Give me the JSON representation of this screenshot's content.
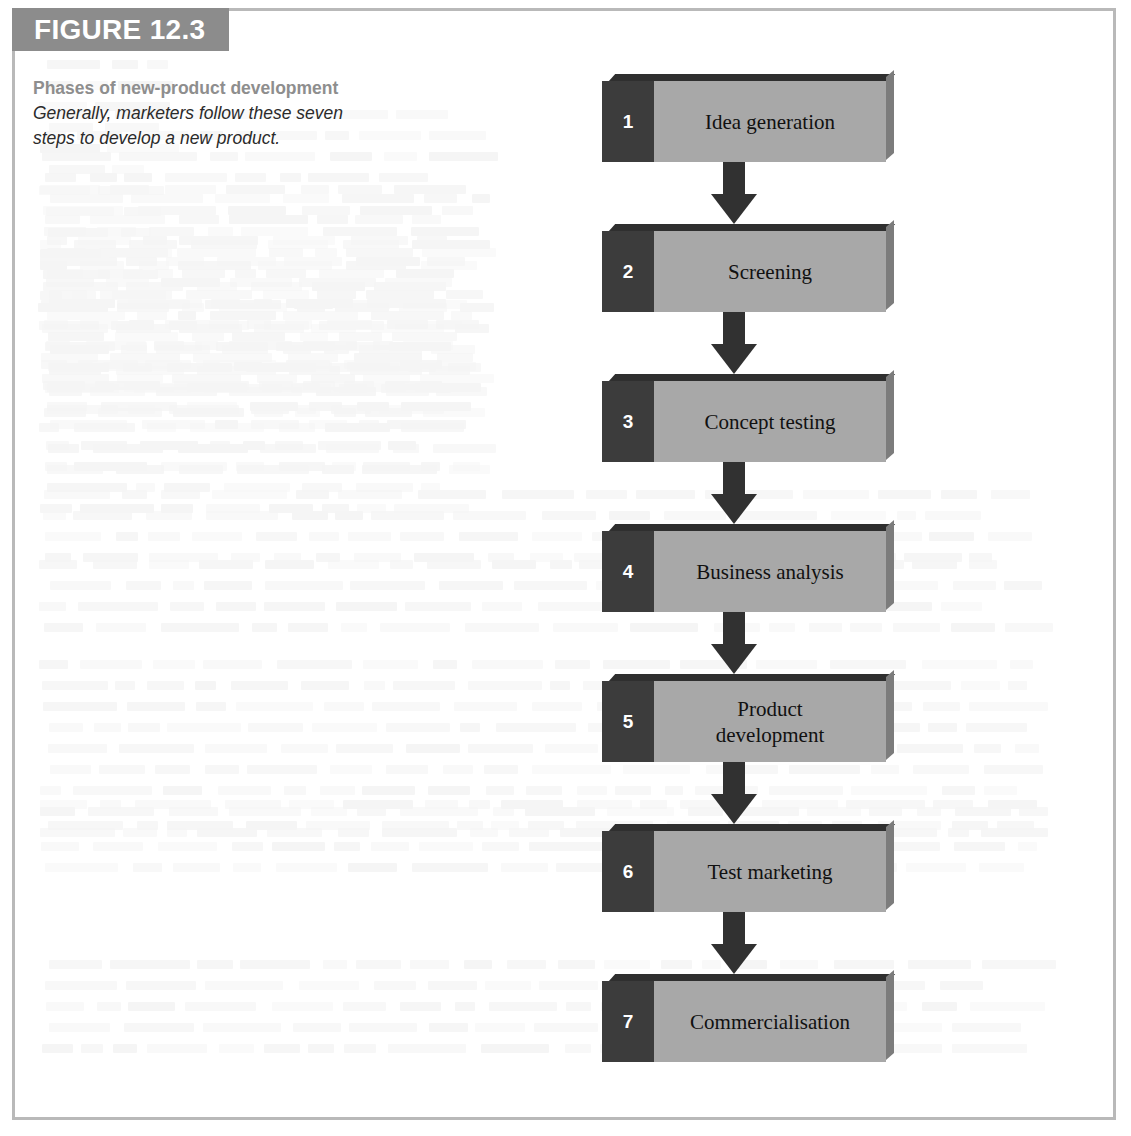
{
  "figure": {
    "number_label": "FIGURE 12.3",
    "caption_title": "Phases of new-product development",
    "caption_description": "Generally, marketers follow these seven steps to develop a new product."
  },
  "chart_data": {
    "type": "diagram",
    "subtype": "vertical-flowchart",
    "title": "Phases of new-product development",
    "direction": "top-to-bottom",
    "connector": "down-arrow",
    "steps": [
      {
        "number": "1",
        "label": "Idea generation"
      },
      {
        "number": "2",
        "label": "Screening"
      },
      {
        "number": "3",
        "label": "Concept testing"
      },
      {
        "number": "4",
        "label": "Business analysis"
      },
      {
        "number": "5",
        "label": "Product\ndevelopment"
      },
      {
        "number": "6",
        "label": "Test marketing"
      },
      {
        "number": "7",
        "label": "Commercialisation"
      }
    ]
  },
  "colors": {
    "header_bar": "#8c8c8c",
    "header_text": "#ffffff",
    "caption_title": "#8e8e8e",
    "caption_desc": "#2b2b2b",
    "step_number_block": "#3c3c3c",
    "step_label_block": "#a8a8a8",
    "step_bevel_top": "#2f2f2f",
    "step_bevel_right": "#7c7c7c",
    "arrow": "#313131",
    "frame_border": "#b9b9b9",
    "page_background": "#ffffff"
  }
}
